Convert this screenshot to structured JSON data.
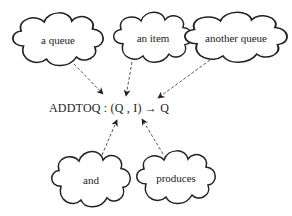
{
  "diagram": {
    "clouds": [
      {
        "id": "a-queue",
        "label": "a queue",
        "cx": 58,
        "cy": 40
      },
      {
        "id": "an-item",
        "label": "an item",
        "cx": 153,
        "cy": 38
      },
      {
        "id": "another-queue",
        "label": "another queue",
        "cx": 236,
        "cy": 38
      },
      {
        "id": "and",
        "label": "and",
        "cx": 91,
        "cy": 180
      },
      {
        "id": "produces",
        "label": "produces",
        "cx": 176,
        "cy": 178
      }
    ],
    "formula": {
      "text": "ADDTOQ : (Q , I) → Q",
      "x": 49,
      "y": 100
    },
    "arrows": [
      {
        "from": "a-queue",
        "to": "Q-input",
        "style": "dashed"
      },
      {
        "from": "an-item",
        "to": "I-input",
        "style": "dashed"
      },
      {
        "from": "another-queue",
        "to": "Q-output",
        "style": "dashed"
      },
      {
        "from": "and",
        "to": "I-input",
        "style": "dashed"
      },
      {
        "from": "produces",
        "to": "arrow-symbol",
        "style": "dashed"
      }
    ],
    "colors": {
      "stroke": "#222222",
      "arrow": "#555555",
      "background": "#ffffff"
    }
  }
}
